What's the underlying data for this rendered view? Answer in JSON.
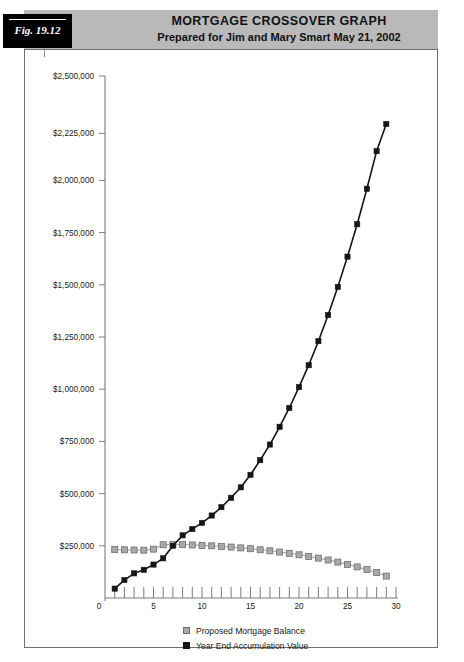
{
  "figure": {
    "tag_label": "Fig. 19.12",
    "title": "MORTGAGE CROSSOVER GRAPH",
    "subtitle": "Prepared for Jim and Mary Smart   May 21, 2002",
    "banner_color": "#b9b9b9",
    "tag_color": "#000000"
  },
  "legend": {
    "position": "bottom-center",
    "items": [
      {
        "label": "Proposed Mortgage Balance",
        "color": "#a9a9a9",
        "marker": "square"
      },
      {
        "label": "Year End Accumulation Value",
        "color": "#151515",
        "marker": "square"
      }
    ]
  },
  "chart_data": {
    "type": "line",
    "title": "MORTGAGE CROSSOVER GRAPH",
    "subtitle": "Prepared for Jim and Mary Smart   May 21, 2002",
    "xlabel": "",
    "ylabel": "",
    "grid": false,
    "legend_position": "bottom-center",
    "xlim": [
      0,
      30
    ],
    "ylim": [
      0,
      2500000
    ],
    "x_tick_interval": 1,
    "x_label_interval": 5,
    "x_tick_labels": [
      "0",
      "5",
      "10",
      "15",
      "20",
      "25",
      "30"
    ],
    "x_tick_values": [
      0,
      5,
      10,
      15,
      20,
      25,
      30
    ],
    "y_tick_values": [
      0,
      250000,
      500000,
      750000,
      1000000,
      1250000,
      1500000,
      1750000,
      2000000,
      2225000,
      2500000
    ],
    "y_tick_labels": [
      "0",
      "$250,000",
      "$500,000",
      "$750,000",
      "$1,000,000",
      "$1,250,000",
      "$1,500,000",
      "$1,750,000",
      "$2,000,000",
      "$2,225,000",
      "$2,500,000"
    ],
    "x": [
      1,
      2,
      3,
      4,
      5,
      6,
      7,
      8,
      9,
      10,
      11,
      12,
      13,
      14,
      15,
      16,
      17,
      18,
      19,
      20,
      21,
      22,
      23,
      24,
      25,
      26,
      27,
      28,
      29
    ],
    "series": [
      {
        "name": "Proposed Mortgage Balance",
        "color": "#a9a9a9",
        "values": [
          232000,
          231000,
          230000,
          229000,
          234000,
          255000,
          257000,
          256000,
          254000,
          252000,
          250000,
          247000,
          244000,
          240000,
          236000,
          231000,
          226000,
          220000,
          214000,
          207000,
          199000,
          191000,
          182000,
          172000,
          161000,
          149000,
          136000,
          122000,
          105000
        ]
      },
      {
        "name": "Year End Accumulation Value",
        "color": "#151515",
        "values": [
          45000,
          86000,
          118000,
          135000,
          160000,
          190000,
          250000,
          300000,
          330000,
          360000,
          395000,
          435000,
          480000,
          530000,
          590000,
          660000,
          735000,
          820000,
          910000,
          1010000,
          1115000,
          1230000,
          1355000,
          1490000,
          1635000,
          1790000,
          1960000,
          2140000,
          2270000
        ]
      }
    ],
    "annotations": [
      {
        "text": "crossover near year 6",
        "x": 6,
        "y": 255000
      }
    ]
  }
}
